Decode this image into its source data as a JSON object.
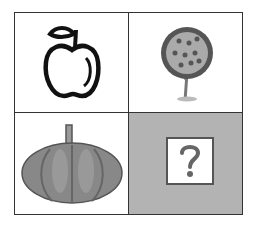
{
  "puzzle": {
    "cells": [
      {
        "position": "top-left",
        "item": "apple-icon",
        "description": "apple outline"
      },
      {
        "position": "top-right",
        "item": "tree-icon",
        "description": "fruit tree"
      },
      {
        "position": "bottom-left",
        "item": "pumpkin-icon",
        "description": "pumpkin"
      },
      {
        "position": "bottom-right",
        "item": "question-mark-icon",
        "description": "unknown answer"
      }
    ],
    "colors": {
      "border": "#333333",
      "answer_cell_bg": "#b3b3b3",
      "question_mark": "#666666"
    }
  }
}
